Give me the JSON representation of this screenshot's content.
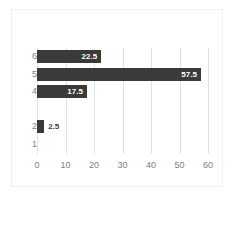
{
  "chart_data": {
    "type": "bar",
    "orientation": "horizontal",
    "title": "",
    "subtitle": "",
    "xlabel": "",
    "ylabel": "",
    "categories": [
      "1",
      "2",
      "3",
      "4",
      "5",
      "6"
    ],
    "values": [
      0,
      2.5,
      0,
      17.5,
      57.5,
      22.5
    ],
    "data_labels": [
      "",
      "2.5",
      "",
      "17.5",
      "57.5",
      "22.5"
    ],
    "xlim": [
      0,
      60
    ],
    "xticks": [
      0,
      10,
      20,
      30,
      40,
      50,
      60
    ],
    "xtick_labels": [
      "0",
      "10",
      "20",
      "30",
      "40",
      "50",
      "60"
    ],
    "ytick_labels": [
      "6",
      "5",
      "4",
      "",
      "2",
      "1"
    ],
    "grid": "vertical",
    "legend": "none",
    "bar_color": "#3a3a3a",
    "grid_color": "#e2e2e2",
    "axis_text_color": "#808080",
    "data_label_color": "#ffffff",
    "outside_label_color": "#404040",
    "background": "#ffffff",
    "border_color": "#f0f0f0"
  },
  "rows": [
    {
      "category": "6",
      "value": 22.5,
      "label": "22.5",
      "label_inside": true
    },
    {
      "category": "5",
      "value": 57.5,
      "label": "57.5",
      "label_inside": true
    },
    {
      "category": "4",
      "value": 17.5,
      "label": "17.5",
      "label_inside": true
    },
    {
      "category": "",
      "value": 0,
      "label": "",
      "label_inside": false
    },
    {
      "category": "2",
      "value": 2.5,
      "label": "2.5",
      "label_inside": false
    },
    {
      "category": "1",
      "value": 0,
      "label": "",
      "label_inside": false
    }
  ],
  "xticks": [
    {
      "label": "0"
    },
    {
      "label": "10"
    },
    {
      "label": "20"
    },
    {
      "label": "30"
    },
    {
      "label": "40"
    },
    {
      "label": "50"
    },
    {
      "label": "60"
    }
  ]
}
